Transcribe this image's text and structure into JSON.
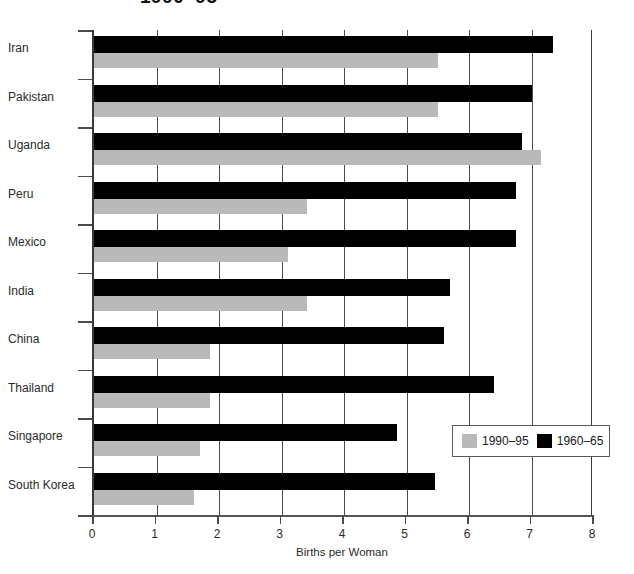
{
  "chart_data": {
    "type": "bar",
    "orientation": "horizontal",
    "title": "1990–95",
    "xlabel": "Births per Woman",
    "ylabel": "",
    "xlim": [
      0,
      8
    ],
    "xticks": [
      "0",
      "1",
      "2",
      "3",
      "4",
      "5",
      "6",
      "7",
      "8"
    ],
    "grid": true,
    "legend_position": "bottom-right",
    "categories": [
      "Iran",
      "Pakistan",
      "Uganda",
      "Peru",
      "Mexico",
      "India",
      "China",
      "Thailand",
      "Singapore",
      "South Korea"
    ],
    "series": [
      {
        "name": "1990–95",
        "color": "#b9b9b9",
        "values": [
          5.5,
          5.5,
          7.15,
          3.4,
          3.1,
          3.4,
          1.85,
          1.85,
          1.7,
          1.6
        ]
      },
      {
        "name": "1960–65",
        "color": "#000000",
        "values": [
          7.35,
          7.0,
          6.85,
          6.75,
          6.75,
          5.7,
          5.6,
          6.4,
          4.85,
          5.45
        ]
      }
    ]
  },
  "legend": {
    "entries": [
      {
        "label": "1990–95",
        "swatch": "recent"
      },
      {
        "label": "1960–65",
        "swatch": "older"
      }
    ]
  }
}
